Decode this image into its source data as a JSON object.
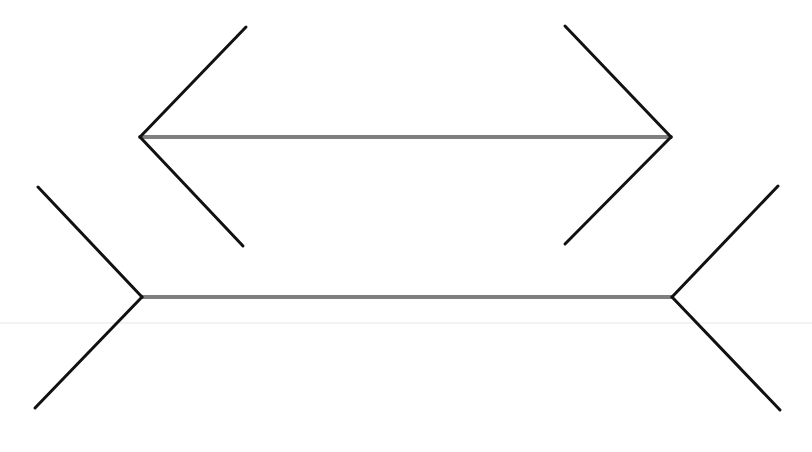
{
  "figure": {
    "type": "muller-lyer-illusion",
    "width": 812,
    "height": 452,
    "background": "#ffffff",
    "colors": {
      "shaft": "#7f7f7f",
      "fin": "#111111",
      "faint_line": "#e6e6e6"
    },
    "faint_line": {
      "x1": 0,
      "y1": 323,
      "x2": 812,
      "y2": 323
    },
    "top_figure": {
      "name": "arrows-inward",
      "shaft": {
        "x1": 140,
        "y1": 137,
        "x2": 671,
        "y2": 137
      },
      "fins": [
        {
          "x1": 140,
          "y1": 137,
          "x2": 246,
          "y2": 27
        },
        {
          "x1": 140,
          "y1": 137,
          "x2": 243,
          "y2": 246
        },
        {
          "x1": 671,
          "y1": 137,
          "x2": 565,
          "y2": 26
        },
        {
          "x1": 671,
          "y1": 137,
          "x2": 565,
          "y2": 244
        }
      ]
    },
    "bottom_figure": {
      "name": "arrows-outward",
      "shaft": {
        "x1": 142,
        "y1": 297,
        "x2": 672,
        "y2": 297
      },
      "fins": [
        {
          "x1": 142,
          "y1": 297,
          "x2": 38,
          "y2": 187
        },
        {
          "x1": 142,
          "y1": 297,
          "x2": 35,
          "y2": 408
        },
        {
          "x1": 672,
          "y1": 297,
          "x2": 778,
          "y2": 186
        },
        {
          "x1": 672,
          "y1": 297,
          "x2": 780,
          "y2": 410
        }
      ]
    }
  }
}
